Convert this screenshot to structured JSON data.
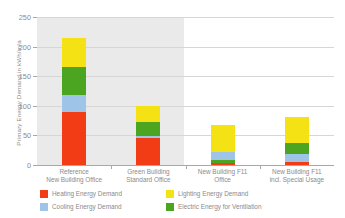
{
  "chart_data": {
    "type": "bar",
    "title": "",
    "subtitle": "",
    "stacked": true,
    "xlabel": "",
    "ylabel": "Primary Energy Demand in kWh/m²a",
    "ylim": [
      0,
      250
    ],
    "yticks": [
      0,
      50,
      100,
      150,
      200,
      250
    ],
    "grid": true,
    "legend_position": "bottom-left",
    "categories": [
      "Reference\nNew Building Office",
      "Green Building\nStandard Office",
      "New Building F11\nOffice",
      "New Building F11\nincl. Special Usage"
    ],
    "series": [
      {
        "name": "Heating Energy Demand",
        "color": "#f23c15",
        "values": [
          90,
          46,
          4,
          5
        ]
      },
      {
        "name": "Cooling Energy Demand",
        "color": "#9ec5e8",
        "values": [
          28,
          3,
          14,
          13
        ]
      },
      {
        "name": "Electric Energy for Ventilation",
        "color": "#4ca521",
        "values": [
          47,
          23,
          4,
          19
        ]
      },
      {
        "name": "Lighting Energy Demand",
        "color": "#f5e215",
        "values": [
          50,
          28,
          45,
          45
        ]
      }
    ],
    "totals": [
      215,
      100,
      67,
      82
    ],
    "stack_order_bottom_to_top": [
      [
        "Heating Energy Demand",
        "Cooling Energy Demand",
        "Electric Energy for Ventilation",
        "Lighting Energy Demand"
      ],
      [
        "Heating Energy Demand",
        "Cooling Energy Demand",
        "Electric Energy for Ventilation",
        "Lighting Energy Demand"
      ],
      [
        "Heating Energy Demand",
        "Electric Energy for Ventilation",
        "Cooling Energy Demand",
        "Lighting Energy Demand"
      ],
      [
        "Heating Energy Demand",
        "Cooling Energy Demand",
        "Electric Energy for Ventilation",
        "Lighting Energy Demand"
      ]
    ]
  },
  "axis": {
    "y_title": "Primary Energy Demand in kWh/m²a",
    "y_ticks": [
      "0",
      "50",
      "100",
      "150",
      "200",
      "250"
    ]
  },
  "x_labels": [
    {
      "line1": "Reference",
      "line2": "New Building Office"
    },
    {
      "line1": "Green Building",
      "line2": "Standard Office"
    },
    {
      "line1": "New Building F11",
      "line2": "Office"
    },
    {
      "line1": "New Building F11",
      "line2": "incl. Special Usage"
    }
  ],
  "legend": {
    "items": [
      {
        "label": "Heating Energy Demand",
        "color": "#f23c15"
      },
      {
        "label": "Lighting Energy Demand",
        "color": "#f5e215"
      },
      {
        "label": "Cooling Energy Demand",
        "color": "#9ec5e8"
      },
      {
        "label": "Electric Energy for Ventilation",
        "color": "#4ca521"
      }
    ]
  },
  "colors": {
    "heating": "#f23c15",
    "cooling": "#9ec5e8",
    "ventilation": "#4ca521",
    "lighting": "#f5e215",
    "shaded_panel": "#eaeaea",
    "gridline": "#d6d6d6",
    "text": "#8b8b8b",
    "background": "#ffffff"
  }
}
